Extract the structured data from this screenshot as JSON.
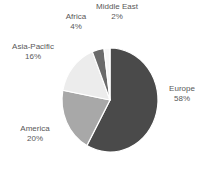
{
  "chart_data": {
    "type": "pie",
    "title": "",
    "subtitle": "",
    "xlabel": "",
    "ylabel": "",
    "legend_position": "none",
    "grid": false,
    "labels_outside": true,
    "start_angle_deg": 0,
    "direction": "clockwise",
    "categories": [
      "Europe",
      "America",
      "Asia-Pacific",
      "Africa",
      "Middle East"
    ],
    "values": [
      58,
      20,
      16,
      4,
      2
    ],
    "value_unit": "%",
    "colors": [
      "#4a4a4a",
      "#a8a8a8",
      "#ececec",
      "#6b6b6b",
      "#f7f7f7"
    ],
    "slices": [
      {
        "name": "Europe",
        "value": 58,
        "label": "Europe",
        "pct_label": "58%",
        "color": "#4a4a4a"
      },
      {
        "name": "America",
        "value": 20,
        "label": "America",
        "pct_label": "20%",
        "color": "#a8a8a8"
      },
      {
        "name": "Asia-Pacific",
        "value": 16,
        "label": "Asia-Pacific",
        "pct_label": "16%",
        "color": "#ececec"
      },
      {
        "name": "Africa",
        "value": 4,
        "label": "Africa",
        "pct_label": "4%",
        "color": "#6b6b6b"
      },
      {
        "name": "Middle East",
        "value": 2,
        "label": "Middle East",
        "pct_label": "2%",
        "color": "#f7f7f7"
      }
    ]
  },
  "labels": {
    "europe": {
      "name": "Europe",
      "pct": "58%"
    },
    "america": {
      "name": "America",
      "pct": "20%"
    },
    "asiapacific": {
      "name": "Asia-Pacific",
      "pct": "16%"
    },
    "africa": {
      "name": "Africa",
      "pct": "4%"
    },
    "middleeast": {
      "name": "Middle East",
      "pct": "2%"
    }
  },
  "style": {
    "background": "#ffffff",
    "text_color": "#585858",
    "slice_border": "#ffffff"
  }
}
